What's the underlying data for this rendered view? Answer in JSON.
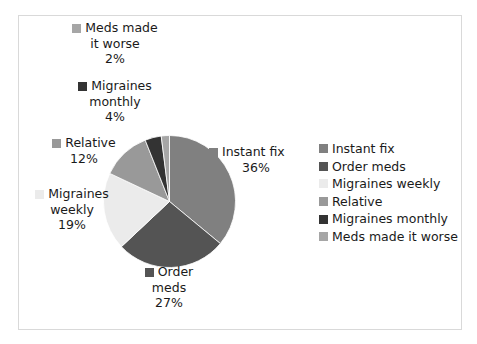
{
  "chart_data": {
    "type": "pie",
    "title": "",
    "legend_position": "right",
    "categories": [
      "Instant fix",
      "Order meds",
      "Migraines weekly",
      "Relative",
      "Migraines monthly",
      "Meds made it worse"
    ],
    "values": [
      36,
      27,
      19,
      12,
      4,
      2
    ],
    "value_labels": [
      "36%",
      "27%",
      "19%",
      "12%",
      "4%",
      "2%"
    ],
    "colors": [
      "#808080",
      "#545454",
      "#ebebeb",
      "#999999",
      "#333333",
      "#a6a6a6"
    ],
    "start_angle_deg": 0,
    "direction": "clockwise",
    "units": "percent"
  },
  "labels": {
    "meds_made_worse": {
      "line1": "Meds made",
      "line2": "it worse",
      "pct": "2%",
      "color": "#a6a6a6"
    },
    "migraines_monthly": {
      "line1": "Migraines",
      "line2": "monthly",
      "pct": "4%",
      "color": "#333333"
    },
    "relative": {
      "line1": "Relative",
      "line2": "",
      "pct": "12%",
      "color": "#999999"
    },
    "migraines_weekly": {
      "line1": "Migraines",
      "line2": "weekly",
      "pct": "19%",
      "color": "#ebebeb"
    },
    "instant_fix": {
      "line1": "Instant fix",
      "line2": "",
      "pct": "36%",
      "color": "#808080"
    },
    "order_meds": {
      "line1": "Order",
      "line2": "meds",
      "pct": "27%",
      "color": "#545454"
    }
  },
  "legend": {
    "items": [
      {
        "label": "Instant fix",
        "color": "#808080"
      },
      {
        "label": "Order meds",
        "color": "#545454"
      },
      {
        "label": "Migraines weekly",
        "color": "#ebebeb"
      },
      {
        "label": "Relative",
        "color": "#999999"
      },
      {
        "label": "Migraines monthly",
        "color": "#333333"
      },
      {
        "label": "Meds made it worse",
        "color": "#a6a6a6"
      }
    ]
  },
  "frame": {
    "border_color": "#d9d9d9",
    "background": "#ffffff"
  }
}
